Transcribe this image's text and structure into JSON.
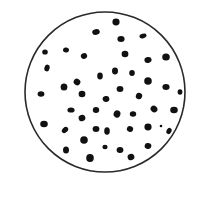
{
  "diagram": {
    "type": "particle-field-in-circle",
    "colors": {
      "background": "#ffffff",
      "outline": "#2a2a2a",
      "dot": "#111111"
    },
    "circle": {
      "cx": 105,
      "cy": 92,
      "r": 80,
      "stroke_width": 1.6
    },
    "dots": [
      {
        "x": 116,
        "y": 22,
        "rx": 3.6,
        "ry": 3.4,
        "rot": 0
      },
      {
        "x": 96,
        "y": 32,
        "rx": 3.8,
        "ry": 2.8,
        "rot": -10
      },
      {
        "x": 143,
        "y": 36,
        "rx": 3.6,
        "ry": 2.2,
        "rot": -15
      },
      {
        "x": 121,
        "y": 39,
        "rx": 3.6,
        "ry": 3.0,
        "rot": 0
      },
      {
        "x": 45,
        "y": 52,
        "rx": 2.8,
        "ry": 2.6,
        "rot": 0
      },
      {
        "x": 66,
        "y": 50,
        "rx": 3.0,
        "ry": 2.5,
        "rot": 10
      },
      {
        "x": 84,
        "y": 56,
        "rx": 3.2,
        "ry": 2.8,
        "rot": -30
      },
      {
        "x": 125,
        "y": 54,
        "rx": 3.4,
        "ry": 3.2,
        "rot": 0
      },
      {
        "x": 148,
        "y": 60,
        "rx": 3.6,
        "ry": 3.0,
        "rot": -10
      },
      {
        "x": 166,
        "y": 57,
        "rx": 3.8,
        "ry": 3.6,
        "rot": 0
      },
      {
        "x": 47,
        "y": 68,
        "rx": 2.6,
        "ry": 3.4,
        "rot": 15
      },
      {
        "x": 115,
        "y": 71,
        "rx": 3.0,
        "ry": 3.4,
        "rot": 0
      },
      {
        "x": 100,
        "y": 76,
        "rx": 2.8,
        "ry": 3.4,
        "rot": 0
      },
      {
        "x": 132,
        "y": 73,
        "rx": 2.8,
        "ry": 3.0,
        "rot": 0
      },
      {
        "x": 77,
        "y": 82,
        "rx": 3.4,
        "ry": 3.2,
        "rot": 30
      },
      {
        "x": 64,
        "y": 87,
        "rx": 3.4,
        "ry": 3.6,
        "rot": 0
      },
      {
        "x": 148,
        "y": 81,
        "rx": 3.8,
        "ry": 3.8,
        "rot": 0
      },
      {
        "x": 166,
        "y": 87,
        "rx": 3.6,
        "ry": 3.0,
        "rot": 0
      },
      {
        "x": 41,
        "y": 94,
        "rx": 3.4,
        "ry": 2.8,
        "rot": 0
      },
      {
        "x": 82,
        "y": 94,
        "rx": 3.4,
        "ry": 3.2,
        "rot": 0
      },
      {
        "x": 120,
        "y": 89,
        "rx": 3.4,
        "ry": 3.0,
        "rot": 0
      },
      {
        "x": 180,
        "y": 92,
        "rx": 2.4,
        "ry": 2.8,
        "rot": 0
      },
      {
        "x": 106,
        "y": 99,
        "rx": 3.4,
        "ry": 3.0,
        "rot": -10
      },
      {
        "x": 139,
        "y": 96,
        "rx": 3.2,
        "ry": 3.2,
        "rot": 20
      },
      {
        "x": 71,
        "y": 110,
        "rx": 3.6,
        "ry": 2.6,
        "rot": 0
      },
      {
        "x": 96,
        "y": 110,
        "rx": 3.2,
        "ry": 3.0,
        "rot": 0
      },
      {
        "x": 154,
        "y": 109,
        "rx": 3.6,
        "ry": 3.2,
        "rot": 45
      },
      {
        "x": 174,
        "y": 110,
        "rx": 3.8,
        "ry": 3.2,
        "rot": 0
      },
      {
        "x": 117,
        "y": 114,
        "rx": 3.4,
        "ry": 3.6,
        "rot": 20
      },
      {
        "x": 133,
        "y": 114,
        "rx": 3.2,
        "ry": 2.8,
        "rot": 0
      },
      {
        "x": 82,
        "y": 118,
        "rx": 3.4,
        "ry": 3.2,
        "rot": -20
      },
      {
        "x": 44,
        "y": 124,
        "rx": 3.8,
        "ry": 3.2,
        "rot": 0
      },
      {
        "x": 65,
        "y": 130,
        "rx": 3.6,
        "ry": 2.6,
        "rot": -45
      },
      {
        "x": 96,
        "y": 129,
        "rx": 3.4,
        "ry": 3.0,
        "rot": 0
      },
      {
        "x": 107,
        "y": 131,
        "rx": 2.8,
        "ry": 3.8,
        "rot": 0
      },
      {
        "x": 130,
        "y": 129,
        "rx": 3.2,
        "ry": 2.8,
        "rot": 20
      },
      {
        "x": 148,
        "y": 127,
        "rx": 3.6,
        "ry": 3.4,
        "rot": 0
      },
      {
        "x": 161,
        "y": 126,
        "rx": 1.3,
        "ry": 1.3,
        "rot": 0
      },
      {
        "x": 169,
        "y": 131,
        "rx": 2.4,
        "ry": 3.2,
        "rot": 30
      },
      {
        "x": 84,
        "y": 140,
        "rx": 3.8,
        "ry": 3.8,
        "rot": 0
      },
      {
        "x": 105,
        "y": 147,
        "rx": 2.6,
        "ry": 2.2,
        "rot": 0
      },
      {
        "x": 120,
        "y": 150,
        "rx": 3.4,
        "ry": 3.0,
        "rot": 0
      },
      {
        "x": 148,
        "y": 146,
        "rx": 3.4,
        "ry": 3.0,
        "rot": 10
      },
      {
        "x": 66,
        "y": 150,
        "rx": 3.0,
        "ry": 3.6,
        "rot": 0
      },
      {
        "x": 131,
        "y": 157,
        "rx": 3.4,
        "ry": 3.2,
        "rot": -20
      },
      {
        "x": 90,
        "y": 158,
        "rx": 3.8,
        "ry": 4.0,
        "rot": 0
      }
    ]
  }
}
